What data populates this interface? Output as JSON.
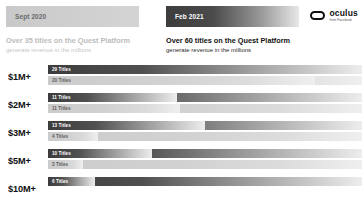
{
  "header": {
    "old_badge": "Sept 2020",
    "new_badge": "Feb 2021",
    "old_headline_main": "Over 35 titles on the Quest Platform",
    "old_headline_sub": "generate revenue in the millions",
    "new_headline_main": "Over 60 titles on the Quest Platform",
    "new_headline_sub": "generate revenue in the millions"
  },
  "logo": {
    "word": "oculus",
    "sub": "from Facebook",
    "mark": "oculus-headset-icon"
  },
  "colors": {
    "dark_bar_start": "#3c3c3c",
    "dark_bar_end": "#ededed",
    "light_bar_start": "#cbcbcb",
    "light_bar_end": "#efefef",
    "old_text": "#bcbcbc",
    "new_text": "#111111"
  },
  "chart_data": {
    "type": "bar",
    "title": "Over 60 titles on the Quest Platform generate revenue in the millions",
    "subtitle": "generate revenue in the millions",
    "xlabel": "",
    "ylabel": "Revenue tier",
    "grid": false,
    "orientation": "horizontal",
    "legend_position": "top",
    "categories": [
      "$1M+",
      "$2M+",
      "$3M+",
      "$5M+",
      "$10M+"
    ],
    "series": [
      {
        "name": "Feb 2021",
        "values": [
          29,
          11,
          13,
          10,
          6
        ]
      },
      {
        "name": "Sept 2020",
        "values": [
          20,
          11,
          4,
          3,
          null
        ]
      }
    ],
    "rows": [
      {
        "label": "$1M+",
        "bars": [
          {
            "series": "Feb 2021",
            "value": 29,
            "text": "29 Titles",
            "style": "dark",
            "width_pct": 100
          },
          {
            "series": "Sept 2020",
            "value": 20,
            "text": "20 Titles",
            "style": "light",
            "width_pct": 85
          }
        ]
      },
      {
        "label": "$2M+",
        "bars": [
          {
            "series": "Feb 2021",
            "value": 11,
            "text": "11 Titles",
            "style": "dark",
            "width_pct": 41
          },
          {
            "series": "Sept 2020",
            "value": 11,
            "text": "11 Titles",
            "style": "light",
            "width_pct": 42
          }
        ]
      },
      {
        "label": "$3M+",
        "bars": [
          {
            "series": "Feb 2021",
            "value": 13,
            "text": "13 Titles",
            "style": "dark",
            "width_pct": 50
          },
          {
            "series": "Sept 2020",
            "value": 4,
            "text": "4 Titles",
            "style": "light",
            "width_pct": 16
          }
        ]
      },
      {
        "label": "$5M+",
        "bars": [
          {
            "series": "Feb 2021",
            "value": 10,
            "text": "10 Titles",
            "style": "dark",
            "width_pct": 33
          },
          {
            "series": "Sept 2020",
            "value": 3,
            "text": "3 Titles",
            "style": "light",
            "width_pct": 11
          }
        ]
      },
      {
        "label": "$10M+",
        "bars": [
          {
            "series": "Feb 2021",
            "value": 6,
            "text": "6 Titles",
            "style": "dark",
            "width_pct": 15
          }
        ]
      }
    ]
  }
}
